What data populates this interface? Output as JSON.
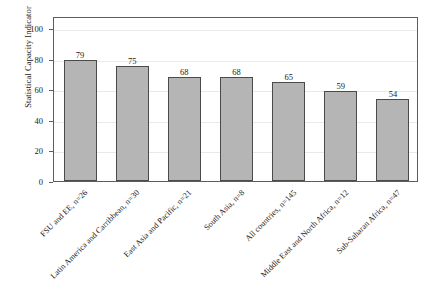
{
  "chart_data": {
    "type": "bar",
    "title": "",
    "xlabel": "",
    "ylabel": "Statistical Capacity Indicator",
    "ylim": [
      0,
      108
    ],
    "yticks": [
      0,
      20,
      40,
      60,
      80,
      100
    ],
    "grid": true,
    "legend": null,
    "categories": [
      "FSU and EE, n=26",
      "Latin America and Carribbean, n=30",
      "East Asia and Pacific, n=21",
      "South Asia, n=8",
      "All countries, n=145",
      "Middle East and North Africa, n=12",
      "Sub-Saharan Africa, n=47"
    ],
    "values": [
      79,
      75,
      68,
      68,
      65,
      59,
      54
    ],
    "value_labels": [
      "79",
      "75",
      "68",
      "68",
      "65",
      "59",
      "54"
    ],
    "bar_color": "#b5b5b5",
    "bar_edge_color": "#4a4a4a",
    "axis_color": "#5d5d5d",
    "grid_color": "#e9e9e9",
    "background": "#ffffff"
  }
}
